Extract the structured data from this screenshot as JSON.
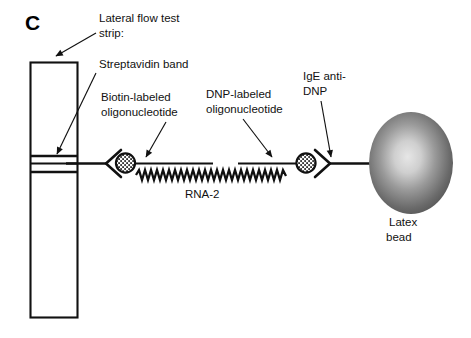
{
  "figure": {
    "panel_letter": "C",
    "type": "lateral flow test strip sandwich assay schematic"
  },
  "labels": {
    "lateral_flow_line1": "Lateral flow test",
    "lateral_flow_line2": "strip:",
    "streptavidin_band": "Streptavidin band",
    "biotin_line1": "Biotin-labeled",
    "biotin_line2": "oligonucleotide",
    "dnp_line1": "DNP-labeled",
    "dnp_line2": "oligonucleotide",
    "ige_line1": "IgE anti-",
    "ige_line2": "DNP",
    "rna2": "RNA-2",
    "latex_line1": "Latex",
    "latex_line2": "bead"
  },
  "colors": {
    "ink": "#111111",
    "bead_dark": "#4a4a4a",
    "bead_mid": "#6e6e6e",
    "bead_light": "#d8d8d8",
    "background": "#ffffff"
  },
  "components": {
    "test_strip": "vertical rectangle membrane",
    "band_lines": 3,
    "left_antibody": "streptavidin capture antibody with biotin bead",
    "right_antibody": "IgE anti-DNP antibody with DNP bead",
    "rna_strand": "zigzag RNA-2 hybridization strand",
    "latex_bead": "shaded latex bead sphere"
  }
}
